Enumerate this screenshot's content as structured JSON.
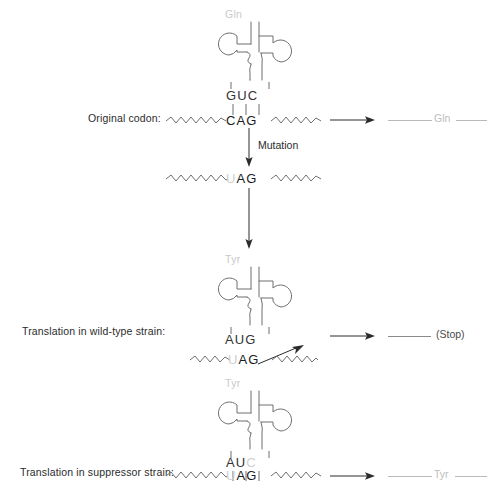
{
  "diagram": {
    "colors": {
      "stroke": "#6f6f6f",
      "text": "#1a1a1a",
      "faded_text": "#c9c9c9",
      "background": "#ffffff"
    }
  },
  "rows": {
    "original": {
      "label": "Original codon:",
      "amino_acid": "Gln",
      "anticodon": "GUC",
      "codon": "CAG",
      "bond_count": 3,
      "product_label": "Gln"
    },
    "mutation": {
      "label": "Mutation",
      "codon": "UAG",
      "codon_faded_first_letter": "U"
    },
    "wildtype": {
      "label": "Translation in wild-type strain:",
      "amino_acid": "Tyr",
      "anticodon": "AUG",
      "codon": "UAG",
      "codon_faded_first_letter": "U",
      "product_label": "(Stop)",
      "rejection_arrow": true
    },
    "suppressor": {
      "label": "Translation in suppressor strain:",
      "amino_acid": "Tyr",
      "anticodon": "AUC",
      "codon": "UAG",
      "codon_faded_first_letter": "U",
      "bond_count": 3,
      "product_label": "Tyr"
    }
  }
}
